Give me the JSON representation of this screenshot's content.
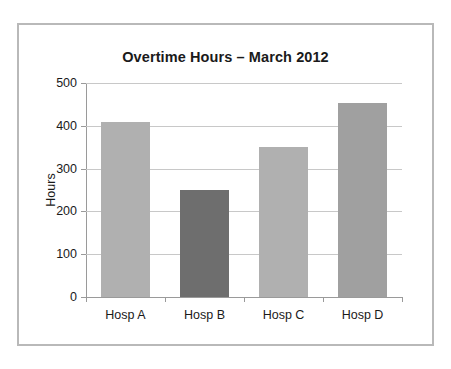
{
  "figure": {
    "background": "#ffffff",
    "border_color": "#b9b9b9"
  },
  "chart_data": {
    "type": "bar",
    "title": "Overtime Hours – March 2012",
    "subtitle": "",
    "xlabel": "",
    "ylabel": "Hours",
    "categories": [
      "Hosp A",
      "Hosp B",
      "Hosp C",
      "Hosp D"
    ],
    "values": [
      410,
      250,
      350,
      453
    ],
    "bar_colors": [
      "#b0b0b0",
      "#6e6e6e",
      "#b0b0b0",
      "#a0a0a0"
    ],
    "ylim": [
      0,
      500
    ],
    "ytick_values": [
      0,
      100,
      200,
      300,
      400,
      500
    ],
    "ytick_labels": [
      "0",
      "100",
      "200",
      "300",
      "400",
      "500"
    ],
    "grid": true,
    "grid_axis": "y",
    "grid_color": "#c8c8c8",
    "axis_color": "#9a9a9a",
    "legend": false,
    "legend_position": "none",
    "annotations": []
  }
}
